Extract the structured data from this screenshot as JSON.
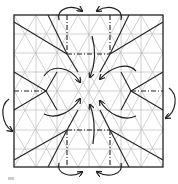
{
  "diagram": {
    "type": "origami-crease-pattern",
    "square": {
      "x": 14,
      "y": 15,
      "width": 149,
      "height": 152
    },
    "colors": {
      "outline": "#222222",
      "crease": "#222222",
      "grid": "#b8b8b8",
      "arrow": "#222222"
    },
    "key_points": [
      {
        "id": "top-left",
        "x": 67,
        "y": 54
      },
      {
        "id": "top-right",
        "x": 110,
        "y": 54
      },
      {
        "id": "mid-left",
        "x": 46,
        "y": 91
      },
      {
        "id": "mid-right",
        "x": 131,
        "y": 91
      },
      {
        "id": "bottom-left",
        "x": 67,
        "y": 130
      },
      {
        "id": "bottom-right",
        "x": 110,
        "y": 130
      },
      {
        "id": "center",
        "x": 89,
        "y": 91
      }
    ],
    "arrows_count": 14
  }
}
